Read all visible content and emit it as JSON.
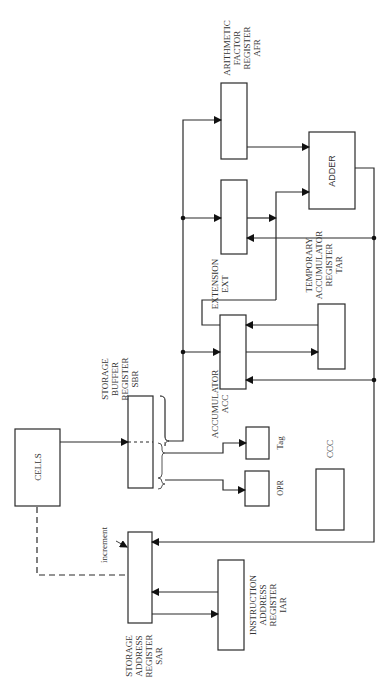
{
  "diagram": {
    "title": "",
    "orientation": "rotated-90-ccw",
    "colors": {
      "stroke": "#2a2a2a",
      "text": "#333333",
      "background": "#ffffff"
    },
    "blocks": {
      "afr": {
        "label_lines": [
          "ARITHMETIC",
          "FACTOR",
          "REGISTER",
          "AFR"
        ]
      },
      "adder": {
        "label": "ADDER"
      },
      "ext": {
        "label_lines": [
          "EXTENSION",
          "EXT"
        ]
      },
      "tar": {
        "label_lines": [
          "TEMPORARY",
          "ACCUMULATOR",
          "REGISTER",
          "TAR"
        ]
      },
      "acc": {
        "label_lines": [
          "ACCUMULATOR",
          "ACC"
        ]
      },
      "sbr": {
        "label_lines": [
          "STORAGE",
          "BUFFER",
          "REGISTER",
          "SBR"
        ]
      },
      "cells": {
        "label": "CELLS"
      },
      "tag": {
        "label": "Tag"
      },
      "opr": {
        "label": "OPR"
      },
      "ccc": {
        "label": "CCC"
      },
      "sar": {
        "label_lines": [
          "STORAGE",
          "ADDRESS",
          "REGISTER",
          "SAR"
        ]
      },
      "iar": {
        "label_lines": [
          "INSTRUCTION",
          "ADDRESS",
          "REGISTER",
          "IAR"
        ]
      }
    },
    "annotations": {
      "increment": "increment"
    },
    "connections": [
      {
        "from": "CELLS",
        "to": "SBR",
        "style": "solid-arrow"
      },
      {
        "from": "SBR",
        "to": "AFR",
        "style": "solid-arrow"
      },
      {
        "from": "SBR",
        "to": "EXT",
        "style": "solid-arrow"
      },
      {
        "from": "SBR",
        "to": "ACC",
        "style": "solid-arrow"
      },
      {
        "from": "SBR",
        "to": "Tag",
        "style": "solid-arrow"
      },
      {
        "from": "SBR",
        "to": "OPR",
        "style": "solid-arrow"
      },
      {
        "from": "AFR",
        "to": "ADDER",
        "style": "solid-arrow"
      },
      {
        "from": "EXT",
        "to": "ADDER",
        "style": "solid-arrow"
      },
      {
        "from": "ACC",
        "to": "ADDER",
        "style": "solid-arrow"
      },
      {
        "from": "ACC",
        "to": "TAR",
        "style": "solid-arrow"
      },
      {
        "from": "TAR",
        "to": "ACC",
        "style": "solid-arrow"
      },
      {
        "from": "ADDER",
        "to": "EXT",
        "style": "solid-arrow"
      },
      {
        "from": "ADDER",
        "to": "ACC",
        "style": "solid-arrow"
      },
      {
        "from": "ADDER",
        "to": "SAR",
        "style": "solid-arrow"
      },
      {
        "from": "IAR",
        "to": "SAR",
        "style": "solid-arrow"
      },
      {
        "from": "SAR",
        "to": "IAR",
        "style": "solid-arrow"
      },
      {
        "from": "SAR",
        "to": "CELLS",
        "style": "dashed"
      }
    ]
  }
}
